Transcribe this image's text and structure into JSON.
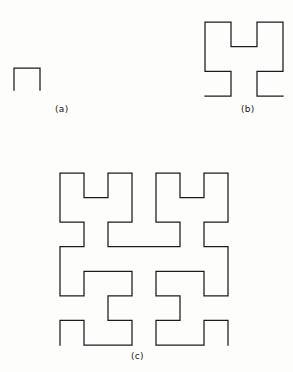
{
  "figure": {
    "kind": "line-drawing",
    "background_color": "#fdfdfc",
    "stroke_color": "#1b1c20",
    "stroke_width": 1.25,
    "panels": [
      {
        "id": "a",
        "label": "(a)",
        "order": 1,
        "grid": 2,
        "bbox": {
          "x": 14,
          "y": 68,
          "width": 26,
          "height": 22
        },
        "points": [
          [
            0,
            0
          ],
          [
            0,
            1
          ],
          [
            1,
            1
          ],
          [
            1,
            0
          ]
        ]
      },
      {
        "id": "b",
        "label": "(b)",
        "order": 2,
        "grid": 4,
        "bbox": {
          "x": 205,
          "y": 22,
          "width": 78,
          "height": 74
        },
        "points": [
          [
            0,
            0
          ],
          [
            1,
            0
          ],
          [
            1,
            1
          ],
          [
            0,
            1
          ],
          [
            0,
            2
          ],
          [
            0,
            3
          ],
          [
            1,
            3
          ],
          [
            1,
            2
          ],
          [
            2,
            2
          ],
          [
            2,
            3
          ],
          [
            3,
            3
          ],
          [
            3,
            2
          ],
          [
            3,
            1
          ],
          [
            2,
            1
          ],
          [
            2,
            0
          ],
          [
            3,
            0
          ]
        ]
      },
      {
        "id": "c",
        "label": "(c)",
        "order": 3,
        "grid": 8,
        "bbox": {
          "x": 60,
          "y": 173,
          "width": 168,
          "height": 172
        },
        "points": [
          [
            0,
            0
          ],
          [
            0,
            1
          ],
          [
            1,
            1
          ],
          [
            1,
            0
          ],
          [
            2,
            0
          ],
          [
            3,
            0
          ],
          [
            3,
            1
          ],
          [
            2,
            1
          ],
          [
            2,
            2
          ],
          [
            3,
            2
          ],
          [
            3,
            3
          ],
          [
            2,
            3
          ],
          [
            1,
            3
          ],
          [
            1,
            2
          ],
          [
            0,
            2
          ],
          [
            0,
            3
          ],
          [
            0,
            4
          ],
          [
            1,
            4
          ],
          [
            1,
            5
          ],
          [
            0,
            5
          ],
          [
            0,
            6
          ],
          [
            0,
            7
          ],
          [
            1,
            7
          ],
          [
            1,
            6
          ],
          [
            2,
            6
          ],
          [
            2,
            7
          ],
          [
            3,
            7
          ],
          [
            3,
            6
          ],
          [
            3,
            5
          ],
          [
            2,
            5
          ],
          [
            2,
            4
          ],
          [
            3,
            4
          ],
          [
            4,
            4
          ],
          [
            5,
            4
          ],
          [
            5,
            5
          ],
          [
            4,
            5
          ],
          [
            4,
            6
          ],
          [
            4,
            7
          ],
          [
            5,
            7
          ],
          [
            5,
            6
          ],
          [
            6,
            6
          ],
          [
            6,
            7
          ],
          [
            7,
            7
          ],
          [
            7,
            6
          ],
          [
            7,
            5
          ],
          [
            6,
            5
          ],
          [
            6,
            4
          ],
          [
            7,
            4
          ],
          [
            7,
            3
          ],
          [
            7,
            2
          ],
          [
            6,
            2
          ],
          [
            6,
            3
          ],
          [
            5,
            3
          ],
          [
            4,
            3
          ],
          [
            4,
            2
          ],
          [
            5,
            2
          ],
          [
            5,
            1
          ],
          [
            4,
            1
          ],
          [
            4,
            0
          ],
          [
            5,
            0
          ],
          [
            6,
            0
          ],
          [
            6,
            1
          ],
          [
            7,
            1
          ],
          [
            7,
            0
          ]
        ]
      }
    ]
  },
  "labels": {
    "a": "(a)",
    "b": "(b)",
    "c": "(c)"
  }
}
